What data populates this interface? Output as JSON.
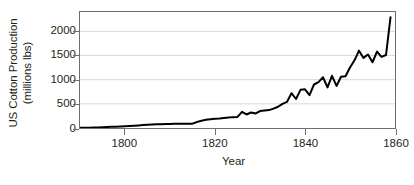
{
  "chart_data": {
    "type": "line",
    "title": "",
    "xlabel": "Year",
    "ylabel_line1": "US Cotton Production",
    "ylabel_line2": "(millions lbs)",
    "ylabel": "US Cotton Production (millions lbs)",
    "xlim": [
      1790,
      1860
    ],
    "ylim": [
      0,
      2400
    ],
    "yticks": [
      0,
      500,
      1000,
      1500,
      2000
    ],
    "ytick_labels": [
      "0",
      "500",
      "1000",
      "1500",
      "2000"
    ],
    "xticks": [
      1800,
      1820,
      1840,
      1860
    ],
    "xtick_labels": [
      "1800",
      "1820",
      "1840",
      "1860"
    ],
    "grid": "horizontal",
    "legend": "none",
    "line_color": "#000000",
    "grid_color": "#d9d9d9",
    "frame_color": "#6d6e71",
    "series": [
      {
        "name": "US Cotton Production",
        "x": [
          1790,
          1791,
          1792,
          1793,
          1794,
          1795,
          1796,
          1797,
          1798,
          1799,
          1800,
          1801,
          1802,
          1803,
          1804,
          1805,
          1806,
          1807,
          1808,
          1809,
          1810,
          1811,
          1812,
          1813,
          1814,
          1815,
          1816,
          1817,
          1818,
          1819,
          1820,
          1821,
          1822,
          1823,
          1824,
          1825,
          1826,
          1827,
          1828,
          1829,
          1830,
          1831,
          1832,
          1833,
          1834,
          1835,
          1836,
          1837,
          1838,
          1839,
          1840,
          1841,
          1842,
          1843,
          1844,
          1845,
          1846,
          1847,
          1848,
          1849,
          1850,
          1851,
          1852,
          1853,
          1854,
          1855,
          1856,
          1857,
          1858,
          1859
        ],
        "y": [
          3,
          5,
          7,
          9,
          12,
          16,
          20,
          24,
          28,
          32,
          36,
          42,
          48,
          54,
          60,
          66,
          72,
          78,
          80,
          82,
          85,
          86,
          86,
          87,
          88,
          90,
          124,
          150,
          170,
          180,
          190,
          196,
          205,
          215,
          225,
          230,
          335,
          280,
          320,
          300,
          350,
          360,
          370,
          400,
          440,
          500,
          540,
          720,
          600,
          790,
          800,
          680,
          900,
          950,
          1050,
          840,
          1080,
          870,
          1060,
          1070,
          1250,
          1400,
          1600,
          1450,
          1520,
          1360,
          1580,
          1470,
          1510,
          2290
        ],
        "units": "millions lbs"
      }
    ]
  }
}
